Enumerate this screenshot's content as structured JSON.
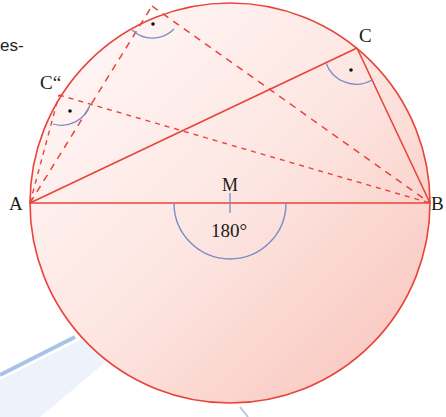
{
  "diagram": {
    "title_fragment": "es-",
    "points": {
      "A": {
        "label": "A",
        "x": 30,
        "y": 203
      },
      "B": {
        "label": "B",
        "x": 430,
        "y": 203
      },
      "M": {
        "label": "M",
        "x": 230,
        "y": 203
      },
      "C": {
        "label": "C",
        "x": 357,
        "y": 48
      },
      "C_prime": {
        "label": "C'",
        "x": 152,
        "y": 6
      },
      "C_double_prime": {
        "label": "C“",
        "x": 59,
        "y": 95
      }
    },
    "central_angle_label": "180°",
    "right_angle_marker": "·",
    "colors": {
      "circle_stroke": "#e8443a",
      "circle_fill_top": "#fdeeee",
      "circle_fill_bottom": "#f9c9c0",
      "angle_arc": "#7a8cc4",
      "ruler": "#a9c3e8"
    }
  }
}
